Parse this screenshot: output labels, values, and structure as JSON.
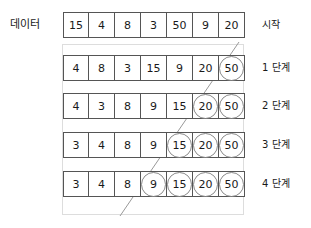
{
  "diagram": {
    "type": "bubble-sort-steps",
    "left_label": "데이터",
    "rows": [
      {
        "id": "row-data",
        "right_label": "시작",
        "values": [
          "15",
          "4",
          "8",
          "3",
          "50",
          "9",
          "20"
        ],
        "circled_count": 0
      },
      {
        "id": "row-step-1",
        "right_label": "1 단계",
        "values": [
          "4",
          "8",
          "3",
          "15",
          "9",
          "20",
          "50"
        ],
        "circled_count": 1
      },
      {
        "id": "row-step-2",
        "right_label": "2 단계",
        "values": [
          "4",
          "3",
          "8",
          "9",
          "15",
          "20",
          "50"
        ],
        "circled_count": 2
      },
      {
        "id": "row-step-3",
        "right_label": "3 단계",
        "values": [
          "3",
          "4",
          "8",
          "9",
          "15",
          "20",
          "50"
        ],
        "circled_count": 3
      },
      {
        "id": "row-step-4",
        "right_label": "4 단계",
        "values": [
          "3",
          "4",
          "8",
          "9",
          "15",
          "20",
          "50"
        ],
        "circled_count": 4
      }
    ],
    "colors": {
      "cell_border": "#555555",
      "circle_stroke": "#8a8a8a",
      "frame_stroke": "#dddddd",
      "diagonal_stroke": "#999999",
      "text": "#1a1a1a",
      "background": "#ffffff"
    },
    "diagonal": {
      "x1": 239,
      "y1": 42,
      "x2": 120,
      "y2": 216
    },
    "geometry": {
      "grid_left": 63,
      "cell_width": 26,
      "cell_height": 26,
      "row_tops": [
        12,
        55,
        93,
        132,
        171
      ]
    }
  }
}
